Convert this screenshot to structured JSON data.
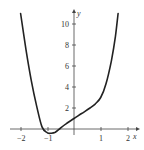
{
  "chart_data": {
    "type": "line",
    "title": "",
    "xlabel": "x",
    "ylabel": "y",
    "xlim": [
      -2.2,
      2.2
    ],
    "ylim": [
      -0.5,
      11
    ],
    "grid": false,
    "legend": null,
    "x_ticks": [
      -2,
      -1,
      1,
      2
    ],
    "y_ticks": [
      2,
      4,
      6,
      8,
      10
    ],
    "series": [
      {
        "name": "curve",
        "x": [
          -2.0,
          -1.8,
          -1.6,
          -1.4,
          -1.2,
          -1.0,
          -0.85,
          -0.7,
          -0.5,
          -0.3,
          0.0,
          0.3,
          0.6,
          0.8,
          1.0,
          1.2,
          1.4,
          1.55,
          1.65
        ],
        "y": [
          11.0,
          7.6,
          4.6,
          2.2,
          0.2,
          -0.35,
          -0.4,
          -0.3,
          0.1,
          0.5,
          1.0,
          1.5,
          2.0,
          2.4,
          3.0,
          4.3,
          6.5,
          8.8,
          11.0
        ]
      }
    ]
  },
  "labels": {
    "x_axis": "x",
    "y_axis": "y",
    "x_tick_labels": [
      "−2",
      "−1",
      "1",
      "2"
    ],
    "y_tick_labels": [
      "2",
      "4",
      "6",
      "8",
      "10"
    ]
  }
}
